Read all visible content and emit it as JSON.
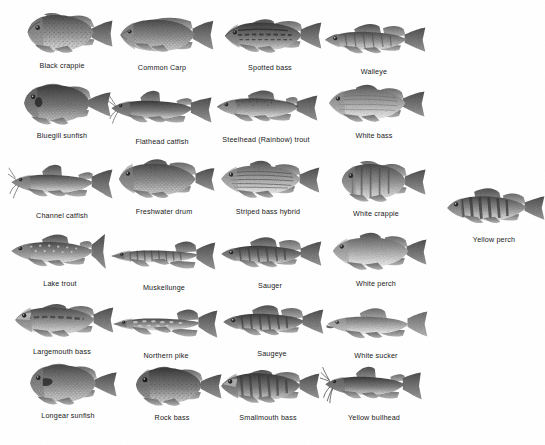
{
  "page": {
    "background_color": "#ffffff",
    "text_color": "#171717",
    "art_style": "grayscale-halftone-illustration",
    "columns": 4,
    "rows": 6
  },
  "fish": [
    {
      "id": "black-crappie",
      "label": "Black crappie",
      "row": 1,
      "col": 1,
      "shape": "crappie",
      "x": 14,
      "y": 10,
      "w": 96,
      "h": 52,
      "flip": false
    },
    {
      "id": "common-carp",
      "label": "Common Carp",
      "row": 1,
      "col": 2,
      "shape": "carp",
      "x": 112,
      "y": 12,
      "w": 100,
      "h": 48,
      "flip": false
    },
    {
      "id": "spotted-bass",
      "label": "Spotted bass",
      "row": 1,
      "col": 3,
      "shape": "bass",
      "x": 220,
      "y": 13,
      "w": 100,
      "h": 46,
      "flip": false
    },
    {
      "id": "walleye",
      "label": "Walleye",
      "row": 1,
      "col": 4,
      "shape": "walleye",
      "x": 320,
      "y": 18,
      "w": 100,
      "h": 40,
      "flip": false
    },
    {
      "id": "bluegill-sunfish",
      "label": "Bluegill sunfish",
      "row": 2,
      "col": 1,
      "shape": "sunfish",
      "x": 16,
      "y": 80,
      "w": 92,
      "h": 50,
      "flip": false
    },
    {
      "id": "flathead-catfish",
      "label": "Flathead catfish",
      "row": 2,
      "col": 2,
      "shape": "catfish",
      "x": 110,
      "y": 88,
      "w": 100,
      "h": 42,
      "flip": false
    },
    {
      "id": "steelhead-trout",
      "label": "Steelhead (Rainbow) trout",
      "row": 2,
      "col": 3,
      "shape": "trout",
      "x": 214,
      "y": 86,
      "w": 104,
      "h": 44,
      "flip": false
    },
    {
      "id": "white-bass",
      "label": "White bass",
      "row": 2,
      "col": 4,
      "shape": "whitebass",
      "x": 322,
      "y": 82,
      "w": 98,
      "h": 48,
      "flip": false
    },
    {
      "id": "channel-catfish",
      "label": "Channel catfish",
      "row": 3,
      "col": 1,
      "shape": "catfish",
      "x": 14,
      "y": 162,
      "w": 102,
      "h": 42,
      "flip": false
    },
    {
      "id": "freshwater-drum",
      "label": "Freshwater drum",
      "row": 3,
      "col": 2,
      "shape": "drum",
      "x": 116,
      "y": 158,
      "w": 96,
      "h": 46,
      "flip": false
    },
    {
      "id": "striped-bass-hybrid",
      "label": "Striped bass hybrid",
      "row": 3,
      "col": 3,
      "shape": "striped",
      "x": 216,
      "y": 158,
      "w": 104,
      "h": 46,
      "flip": false
    },
    {
      "id": "white-crappie",
      "label": "White crappie",
      "row": 3,
      "col": 4,
      "shape": "crappie",
      "x": 328,
      "y": 160,
      "w": 90,
      "h": 46,
      "flip": false
    },
    {
      "id": "lake-trout",
      "label": "Lake trout",
      "row": 4,
      "col": 1,
      "shape": "laketrout",
      "x": 12,
      "y": 230,
      "w": 104,
      "h": 44,
      "flip": false
    },
    {
      "id": "muskellunge",
      "label": "Muskellunge",
      "row": 4,
      "col": 2,
      "shape": "pike",
      "x": 112,
      "y": 234,
      "w": 104,
      "h": 38,
      "flip": false
    },
    {
      "id": "sauger",
      "label": "Sauger",
      "row": 4,
      "col": 3,
      "shape": "walleye",
      "x": 218,
      "y": 232,
      "w": 100,
      "h": 40,
      "flip": false
    },
    {
      "id": "white-perch",
      "label": "White perch",
      "row": 4,
      "col": 4,
      "shape": "whitebass",
      "x": 326,
      "y": 230,
      "w": 94,
      "h": 44,
      "flip": false
    },
    {
      "id": "largemouth-bass",
      "label": "Largemouth bass",
      "row": 5,
      "col": 1,
      "shape": "bass",
      "x": 14,
      "y": 298,
      "w": 102,
      "h": 44,
      "flip": false
    },
    {
      "id": "northern-pike",
      "label": "Northern pike",
      "row": 5,
      "col": 2,
      "shape": "pike",
      "x": 114,
      "y": 302,
      "w": 102,
      "h": 38,
      "flip": false
    },
    {
      "id": "saugeye",
      "label": "Saugeye",
      "row": 5,
      "col": 3,
      "shape": "walleye",
      "x": 220,
      "y": 300,
      "w": 100,
      "h": 40,
      "flip": false
    },
    {
      "id": "white-sucker",
      "label": "White sucker",
      "row": 5,
      "col": 4,
      "shape": "sucker",
      "x": 326,
      "y": 302,
      "w": 100,
      "h": 38,
      "flip": false
    },
    {
      "id": "longear-sunfish",
      "label": "Longear sunfish",
      "row": 6,
      "col": 1,
      "shape": "sunfish",
      "x": 20,
      "y": 362,
      "w": 92,
      "h": 48,
      "flip": false
    },
    {
      "id": "rock-bass",
      "label": "Rock bass",
      "row": 6,
      "col": 2,
      "shape": "sunfish",
      "x": 122,
      "y": 364,
      "w": 88,
      "h": 46,
      "flip": false
    },
    {
      "id": "smallmouth-bass",
      "label": "Smallmouth bass",
      "row": 6,
      "col": 3,
      "shape": "bass",
      "x": 218,
      "y": 364,
      "w": 100,
      "h": 44,
      "flip": false
    },
    {
      "id": "yellow-bullhead",
      "label": "Yellow bullhead",
      "row": 6,
      "col": 4,
      "shape": "bullhead",
      "x": 324,
      "y": 364,
      "w": 100,
      "h": 42,
      "flip": false
    },
    {
      "id": "yellow-perch",
      "label": "Yellow perch",
      "row": 3,
      "col": 5,
      "shape": "perch",
      "x": 448,
      "y": 186,
      "w": 92,
      "h": 44,
      "flip": false
    }
  ],
  "label_rows_y": [
    70,
    140,
    212,
    280,
    346,
    412
  ],
  "label_columns_x": [
    8,
    110,
    216,
    320,
    444
  ]
}
